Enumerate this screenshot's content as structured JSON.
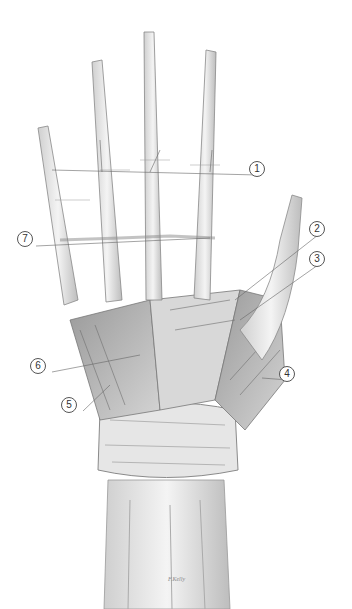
{
  "figure": {
    "labels": [
      {
        "id": "1",
        "text": "1",
        "x": 256,
        "y": 168
      },
      {
        "id": "2",
        "text": "2",
        "x": 316,
        "y": 228
      },
      {
        "id": "3",
        "text": "3",
        "x": 316,
        "y": 258
      },
      {
        "id": "4",
        "text": "4",
        "x": 286,
        "y": 373
      },
      {
        "id": "5",
        "text": "5",
        "x": 68,
        "y": 404
      },
      {
        "id": "6",
        "text": "6",
        "x": 37,
        "y": 365
      },
      {
        "id": "7",
        "text": "7",
        "x": 24,
        "y": 238
      }
    ],
    "signature": "F.Kelly"
  }
}
